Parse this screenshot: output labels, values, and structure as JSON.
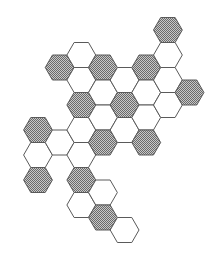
{
  "diagram": {
    "type": "hexagonal-grid",
    "orientation": "flat-top",
    "colors": {
      "outline": "#5a5a5a",
      "filled": "#8a8a8a",
      "filled_light": "#c8c8c8",
      "empty": "#ffffff",
      "background": "#ffffff"
    },
    "geometry": {
      "origin_x": 38,
      "col_spacing": 21.65,
      "radius": 14.4,
      "half_height": 12.5
    },
    "cells": [
      {
        "col": 0,
        "cy": 130,
        "filled": true
      },
      {
        "col": 0,
        "cy": 155,
        "filled": false
      },
      {
        "col": 0,
        "cy": 180,
        "filled": true
      },
      {
        "col": 1,
        "cy": 67.5,
        "filled": true
      },
      {
        "col": 1,
        "cy": 142.5,
        "filled": false
      },
      {
        "col": 2,
        "cy": 55,
        "filled": false
      },
      {
        "col": 2,
        "cy": 80,
        "filled": false
      },
      {
        "col": 2,
        "cy": 105,
        "filled": true
      },
      {
        "col": 2,
        "cy": 130,
        "filled": false
      },
      {
        "col": 2,
        "cy": 155,
        "filled": false
      },
      {
        "col": 2,
        "cy": 180,
        "filled": true
      },
      {
        "col": 2,
        "cy": 205,
        "filled": false
      },
      {
        "col": 3,
        "cy": 67.5,
        "filled": true
      },
      {
        "col": 3,
        "cy": 92.5,
        "filled": false
      },
      {
        "col": 3,
        "cy": 117.5,
        "filled": false
      },
      {
        "col": 3,
        "cy": 142.5,
        "filled": true
      },
      {
        "col": 3,
        "cy": 192.5,
        "filled": false
      },
      {
        "col": 3,
        "cy": 217.5,
        "filled": true
      },
      {
        "col": 4,
        "cy": 80,
        "filled": false
      },
      {
        "col": 4,
        "cy": 105,
        "filled": true
      },
      {
        "col": 4,
        "cy": 130,
        "filled": false
      },
      {
        "col": 4,
        "cy": 230,
        "filled": false
      },
      {
        "col": 5,
        "cy": 67.5,
        "filled": true
      },
      {
        "col": 5,
        "cy": 92.5,
        "filled": false
      },
      {
        "col": 5,
        "cy": 117.5,
        "filled": false
      },
      {
        "col": 5,
        "cy": 142.5,
        "filled": true
      },
      {
        "col": 6,
        "cy": 30,
        "filled": true
      },
      {
        "col": 6,
        "cy": 55,
        "filled": false
      },
      {
        "col": 6,
        "cy": 80,
        "filled": false
      },
      {
        "col": 6,
        "cy": 105,
        "filled": false
      },
      {
        "col": 7,
        "cy": 92.5,
        "filled": true
      }
    ],
    "counts": {
      "total": 31,
      "filled": 13,
      "empty": 18
    }
  }
}
